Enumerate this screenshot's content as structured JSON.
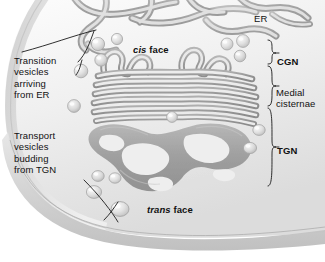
{
  "figure": {
    "palette": {
      "background": "#ffffff",
      "cytoplasm_light": "#f2f2f2",
      "cytoplasm_mid": "#dcdcdc",
      "cytoplasm_dark": "#b8b8b8",
      "membrane_gray": "#9a9a9a",
      "membrane_dark": "#8a8a8a",
      "lumen_light": "#e8e8e8",
      "vesicle_fill": "#d8d8d8",
      "vesicle_highlight": "#f5f5f5",
      "text": "#111111",
      "leader_line": "#1a1a1a"
    }
  },
  "labels": {
    "transition_vesicles": "Transition\nvesicles\narriving\nfrom ER",
    "transport_vesicles": "Transport\nvesicles\nbudding\nfrom TGN",
    "cis_face_italic": "cis",
    "cis_face_rest": " face",
    "trans_face_italic": "trans",
    "trans_face_rest": " face",
    "er": "ER",
    "cgn": "CGN",
    "medial_cisternae": "Medial\ncisternae",
    "tgn": "TGN"
  },
  "brackets": [
    {
      "name": "cgn",
      "label": "CGN",
      "top": 40,
      "bottom": 64
    },
    {
      "name": "medial",
      "label": "Medial cisternae",
      "top": 66,
      "bottom": 106
    },
    {
      "name": "tgn",
      "label": "TGN",
      "top": 108,
      "bottom": 186
    }
  ],
  "structures": {
    "er": "endoplasmic-reticulum-tubules",
    "cgn": "cis-golgi-network",
    "cisternae": "medial-cisternae-stack",
    "tgn": "trans-golgi-network",
    "transition_vesicles_count": 7,
    "transport_vesicles_count": 6
  }
}
